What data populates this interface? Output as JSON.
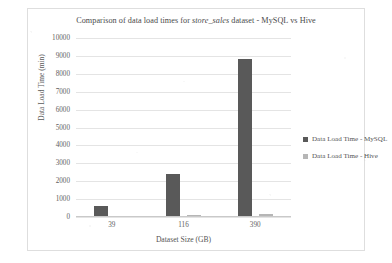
{
  "chart_data": {
    "type": "bar",
    "title": "Comparison of data load times for store_sales dataset - MySQL vs Hive",
    "title_pre": "Comparison of data load times for ",
    "title_em": "store_sales",
    "title_post": " dataset - MySQL vs Hive",
    "xlabel": "Dataset Size (GB)",
    "ylabel": "Data Load Time (min)",
    "categories": [
      "39",
      "116",
      "390"
    ],
    "series": [
      {
        "name": "Data Load Time - MySQL",
        "color": "#595959",
        "values": [
          600,
          2400,
          8800
        ]
      },
      {
        "name": "Data Load Time - Hive",
        "color": "#b6b6b6",
        "values": [
          60,
          100,
          150
        ]
      }
    ],
    "ylim": [
      0,
      10000
    ],
    "ytick_step": 1000,
    "yticks": [
      "10000",
      "9000",
      "8000",
      "7000",
      "6000",
      "5000",
      "4000",
      "3000",
      "2000",
      "1000",
      "0"
    ],
    "grid": true,
    "legend_position": "right"
  }
}
